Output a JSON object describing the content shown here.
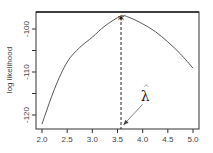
{
  "chart_data": {
    "type": "line",
    "title": "",
    "xlabel": "",
    "ylabel": "log likelihood",
    "xlim": [
      2.0,
      5.0
    ],
    "ylim": [
      -122.5,
      -96.5
    ],
    "xticks": [
      2.0,
      2.5,
      3.0,
      3.5,
      4.0,
      4.5,
      5.0
    ],
    "xtick_labels": [
      "2.0",
      "2.5",
      "3.0",
      "3.5",
      "4.0",
      "4.5",
      "5.0"
    ],
    "yticks": [
      -120,
      -115,
      -110,
      -105,
      -100
    ],
    "ytick_labels": [
      "-120",
      "",
      "-110",
      "",
      "-100"
    ],
    "grid": false,
    "series": [
      {
        "name": "log likelihood",
        "x": [
          2.0,
          2.25,
          2.5,
          2.75,
          3.0,
          3.25,
          3.57,
          3.75,
          4.0,
          4.25,
          4.5,
          4.75,
          5.0
        ],
        "values": [
          -122.1,
          -113.9,
          -107.7,
          -104.3,
          -101.9,
          -99.3,
          -97.0,
          -97.4,
          -98.8,
          -100.6,
          -103.0,
          -105.8,
          -109.1
        ]
      }
    ],
    "annotations": [
      {
        "type": "marker",
        "symbol": "*",
        "x": 3.57,
        "y": -97.0,
        "label": "maximum"
      },
      {
        "type": "vline",
        "style": "dashed",
        "x": 3.57
      },
      {
        "type": "text",
        "text": "λ̂",
        "x": 4.05,
        "y": -115.5
      },
      {
        "type": "arrow",
        "from": [
          4.0,
          -117.5
        ],
        "to": [
          3.62,
          -122.3
        ]
      }
    ],
    "estimate_label": "λ",
    "estimate_hat": "^"
  },
  "axes": {
    "ylabel": "log likelihood",
    "ytick_labels": [
      "-100",
      "-110",
      "-120"
    ]
  }
}
